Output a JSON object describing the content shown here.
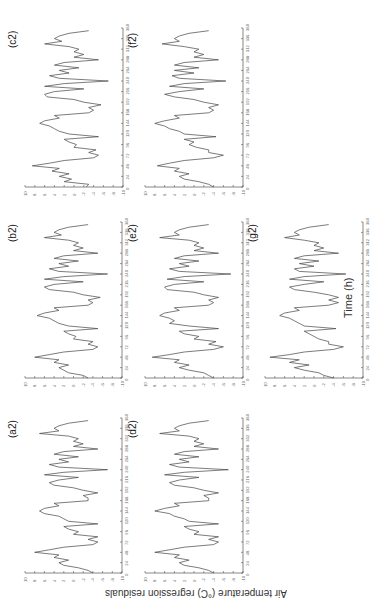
{
  "figure": {
    "xlabel": "Time (h)",
    "ylabel": "Air temperature (°C) regression residuals",
    "orientation": "rotated 90° counter-clockwise"
  },
  "chart_data": [
    {
      "type": "line",
      "title": "(c2)",
      "xlabel": "Time (h)",
      "ylabel": "Air temperature (°C) regression residuals",
      "xlim": [
        0,
        360
      ],
      "ylim": [
        -10,
        10
      ],
      "x_ticks": [
        0,
        24,
        48,
        72,
        96,
        120,
        144,
        168,
        192,
        216,
        240,
        264,
        288,
        312,
        336,
        360
      ],
      "y_ticks": [
        10,
        8,
        6,
        4,
        2,
        0,
        -2,
        -4,
        -6,
        -8,
        -10
      ],
      "x": [
        0,
        6,
        12,
        18,
        24,
        30,
        36,
        42,
        48,
        54,
        60,
        66,
        72,
        78,
        84,
        90,
        96,
        102,
        108,
        114,
        120,
        126,
        132,
        138,
        144,
        150,
        156,
        162,
        168,
        174,
        180,
        186,
        192,
        198,
        204,
        210,
        216,
        222,
        228,
        234,
        240,
        246,
        252,
        258,
        264,
        270,
        276,
        282,
        288,
        294,
        300,
        306,
        312,
        318,
        324,
        330,
        336,
        342,
        348,
        354
      ],
      "values": [
        -2.5,
        -3,
        2,
        0.5,
        3,
        1,
        4.5,
        3,
        8.5,
        5,
        2,
        -4,
        -5,
        -3,
        -4.5,
        0,
        -0.5,
        1,
        2,
        -5,
        1,
        3,
        4,
        5,
        7,
        6,
        3,
        4,
        -3,
        -4,
        -3,
        -5.5,
        -2,
        0,
        5.5,
        6,
        4,
        -2,
        6,
        2,
        -7,
        3,
        5,
        1,
        3,
        -1,
        4,
        2,
        -5,
        0,
        -2,
        0,
        -1,
        1,
        6,
        2.5,
        4,
        3,
        1,
        -3
      ]
    },
    {
      "type": "line",
      "title": "(f2)",
      "xlabel": "Time (h)",
      "ylabel": "Air temperature (°C) regression residuals",
      "xlim": [
        0,
        360
      ],
      "ylim": [
        -10,
        10
      ],
      "x_ticks": [
        0,
        24,
        48,
        72,
        96,
        120,
        144,
        168,
        192,
        216,
        240,
        264,
        288,
        312,
        336,
        360
      ],
      "y_ticks": [
        10,
        8,
        6,
        4,
        2,
        0,
        -2,
        -4,
        -6,
        -8,
        -10
      ],
      "x": [
        0,
        6,
        12,
        18,
        24,
        30,
        36,
        42,
        48,
        54,
        60,
        66,
        72,
        78,
        84,
        90,
        96,
        102,
        108,
        114,
        120,
        126,
        132,
        138,
        144,
        150,
        156,
        162,
        168,
        174,
        180,
        186,
        192,
        198,
        204,
        210,
        216,
        222,
        228,
        234,
        240,
        246,
        252,
        258,
        264,
        270,
        276,
        282,
        288,
        294,
        300,
        306,
        312,
        318,
        324,
        330,
        336,
        342,
        348,
        354
      ],
      "values": [
        -4,
        -3,
        -1,
        2,
        3,
        1,
        4,
        3,
        7.5,
        5,
        2,
        -4,
        -6,
        -3,
        -3,
        -0.5,
        1,
        0,
        2,
        -4.5,
        2,
        3,
        5,
        6,
        8,
        6,
        3,
        4,
        -3,
        -4,
        -3,
        -5,
        -2,
        0,
        4,
        6,
        3,
        -2,
        5,
        2,
        -6.5,
        3,
        4.5,
        0,
        4,
        -1,
        4,
        2,
        -5,
        0,
        -2,
        0,
        -1,
        2,
        6.5,
        3,
        4,
        3,
        1,
        -3
      ]
    },
    {
      "type": "line",
      "title": "(b2)",
      "xlabel": "Time (h)",
      "ylabel": "Air temperature (°C) regression residuals",
      "xlim": [
        0,
        360
      ],
      "ylim": [
        -10,
        10
      ],
      "x_ticks": [
        0,
        24,
        48,
        72,
        96,
        120,
        144,
        168,
        192,
        216,
        240,
        264,
        288,
        312,
        336,
        360
      ],
      "y_ticks": [
        10,
        8,
        6,
        4,
        2,
        0,
        -2,
        -4,
        -6,
        -8,
        -10
      ],
      "x": [
        0,
        6,
        12,
        18,
        24,
        30,
        36,
        42,
        48,
        54,
        60,
        66,
        72,
        78,
        84,
        90,
        96,
        102,
        108,
        114,
        120,
        126,
        132,
        138,
        144,
        150,
        156,
        162,
        168,
        174,
        180,
        186,
        192,
        198,
        204,
        210,
        216,
        222,
        228,
        234,
        240,
        246,
        252,
        258,
        264,
        270,
        276,
        282,
        288,
        294,
        300,
        306,
        312,
        318,
        324,
        330,
        336,
        342,
        348,
        354
      ],
      "values": [
        -3,
        -2,
        1,
        2,
        3,
        1,
        4,
        3,
        8,
        5,
        2,
        -4,
        -5,
        -3,
        -4,
        0,
        -0.5,
        1,
        2,
        -5,
        1,
        3,
        4,
        5,
        7.5,
        6,
        3,
        4,
        -3,
        -4,
        -3,
        -5.5,
        -2,
        0,
        5,
        6,
        4,
        -2,
        6,
        2,
        -7,
        3,
        5,
        1,
        3,
        -1,
        4,
        2,
        -5,
        0,
        -2,
        0,
        -1,
        1,
        6,
        2.5,
        4,
        3,
        1,
        -3
      ]
    },
    {
      "type": "line",
      "title": "(e2)",
      "xlabel": "Time (h)",
      "ylabel": "Air temperature (°C) regression residuals",
      "xlim": [
        0,
        360
      ],
      "ylim": [
        -10,
        10
      ],
      "x_ticks": [
        0,
        24,
        48,
        72,
        96,
        120,
        144,
        168,
        192,
        216,
        240,
        264,
        288,
        312,
        336,
        360
      ],
      "y_ticks": [
        10,
        8,
        6,
        4,
        2,
        0,
        -2,
        -4,
        -6,
        -8,
        -10
      ],
      "x": [
        0,
        6,
        12,
        18,
        24,
        30,
        36,
        42,
        48,
        54,
        60,
        66,
        72,
        78,
        84,
        90,
        96,
        102,
        108,
        114,
        120,
        126,
        132,
        138,
        144,
        150,
        156,
        162,
        168,
        174,
        180,
        186,
        192,
        198,
        204,
        210,
        216,
        222,
        228,
        234,
        240,
        246,
        252,
        258,
        264,
        270,
        276,
        282,
        288,
        294,
        300,
        306,
        312,
        318,
        324,
        330,
        336,
        342,
        348,
        354
      ],
      "values": [
        -4,
        -3,
        -2,
        1,
        3,
        1,
        4,
        3,
        8.5,
        5,
        2,
        -4,
        -6,
        -3,
        -4.5,
        0,
        -1,
        2,
        3,
        -5,
        1,
        5,
        4,
        5,
        7,
        6,
        3,
        4,
        -3,
        -4,
        -3,
        -5,
        -2,
        0,
        5.5,
        6,
        4,
        -2,
        5.5,
        2,
        -7.5,
        3,
        5,
        1,
        3,
        -1,
        4,
        2,
        -5,
        0,
        -2,
        0,
        -1,
        1,
        7,
        3,
        4,
        3,
        1,
        -3
      ]
    },
    {
      "type": "line",
      "title": "(g2)",
      "xlabel": "Time (h)",
      "ylabel": "Air temperature (°C) regression residuals",
      "xlim": [
        0,
        360
      ],
      "ylim": [
        -10,
        10
      ],
      "x_ticks": [
        0,
        24,
        48,
        72,
        96,
        120,
        144,
        168,
        192,
        216,
        240,
        264,
        288,
        312,
        336,
        360
      ],
      "y_ticks": [
        10,
        8,
        6,
        4,
        2,
        0,
        -2,
        -4,
        -6,
        -8,
        -10
      ],
      "x": [
        0,
        6,
        12,
        18,
        24,
        30,
        36,
        42,
        48,
        54,
        60,
        66,
        72,
        78,
        84,
        90,
        96,
        102,
        108,
        114,
        120,
        126,
        132,
        138,
        144,
        150,
        156,
        162,
        168,
        174,
        180,
        186,
        192,
        198,
        204,
        210,
        216,
        222,
        228,
        234,
        240,
        246,
        252,
        258,
        264,
        270,
        276,
        282,
        288,
        294,
        300,
        306,
        312,
        318,
        324,
        330,
        336,
        342,
        348,
        354
      ],
      "values": [
        -4,
        -2,
        -1,
        2,
        4,
        1,
        5,
        3,
        9,
        5,
        2,
        -4,
        -6,
        -3,
        -3,
        -1,
        0,
        1,
        2,
        -4.5,
        2,
        3,
        4,
        5,
        7,
        6,
        3,
        4,
        -3,
        -5,
        -3,
        -5,
        -3,
        0,
        4,
        5,
        2,
        -2,
        5,
        2,
        -6.5,
        3,
        4,
        0,
        3,
        -1,
        4,
        2,
        -5,
        0,
        -2,
        0,
        -1,
        2,
        6,
        3,
        4,
        3,
        1,
        -3
      ]
    },
    {
      "type": "line",
      "title": "(a2)",
      "xlabel": "Time (h)",
      "ylabel": "Air temperature (°C) regression residuals",
      "xlim": [
        0,
        360
      ],
      "ylim": [
        -10,
        10
      ],
      "x_ticks": [
        0,
        24,
        48,
        72,
        96,
        120,
        144,
        168,
        192,
        216,
        240,
        264,
        288,
        312,
        336,
        360
      ],
      "y_ticks": [
        10,
        8,
        6,
        4,
        2,
        0,
        -2,
        -4,
        -6,
        -8,
        -10
      ],
      "x": [
        0,
        6,
        12,
        18,
        24,
        30,
        36,
        42,
        48,
        54,
        60,
        66,
        72,
        78,
        84,
        90,
        96,
        102,
        108,
        114,
        120,
        126,
        132,
        138,
        144,
        150,
        156,
        162,
        168,
        174,
        180,
        186,
        192,
        198,
        204,
        210,
        216,
        222,
        228,
        234,
        240,
        246,
        252,
        258,
        264,
        270,
        276,
        282,
        288,
        294,
        300,
        306,
        312,
        318,
        324,
        330,
        336,
        342,
        348,
        354
      ],
      "values": [
        -4,
        -3,
        -1,
        2,
        3,
        1,
        4,
        3,
        8,
        5,
        2,
        -4,
        -5,
        -3,
        -5,
        0,
        -1,
        1,
        2,
        -5,
        1,
        2,
        3,
        6,
        7,
        6,
        3,
        4,
        -3,
        -3,
        -2,
        -5,
        -2,
        0,
        4,
        5,
        3,
        -1,
        6,
        2,
        -7,
        3,
        5,
        1,
        3,
        -1,
        4,
        2,
        -5,
        0,
        -2,
        0,
        -1,
        1,
        7,
        3,
        4,
        3,
        1,
        -3
      ]
    },
    {
      "type": "line",
      "title": "(d2)",
      "xlabel": "Time (h)",
      "ylabel": "Air temperature (°C) regression residuals",
      "xlim": [
        0,
        360
      ],
      "ylim": [
        -10,
        10
      ],
      "x_ticks": [
        0,
        24,
        48,
        72,
        96,
        120,
        144,
        168,
        192,
        216,
        240,
        264,
        288,
        312,
        336,
        360
      ],
      "y_ticks": [
        10,
        8,
        6,
        4,
        2,
        0,
        -2,
        -4,
        -6,
        -8,
        -10
      ],
      "x": [
        0,
        6,
        12,
        18,
        24,
        30,
        36,
        42,
        48,
        54,
        60,
        66,
        72,
        78,
        84,
        90,
        96,
        102,
        108,
        114,
        120,
        126,
        132,
        138,
        144,
        150,
        156,
        162,
        168,
        174,
        180,
        186,
        192,
        198,
        204,
        210,
        216,
        222,
        228,
        234,
        240,
        246,
        252,
        258,
        264,
        270,
        276,
        282,
        288,
        294,
        300,
        306,
        312,
        318,
        324,
        330,
        336,
        342,
        348,
        354
      ],
      "values": [
        -4,
        -3,
        -1,
        2,
        3,
        1,
        4,
        3,
        8,
        5,
        2,
        -4,
        -5,
        -3,
        -5,
        0,
        -1,
        1,
        2,
        -5,
        1,
        2,
        4,
        5,
        8,
        6,
        3,
        4,
        -3,
        -3,
        -2,
        -5,
        -2,
        0,
        4,
        5,
        3,
        -1,
        6,
        2,
        -7,
        3,
        5,
        1,
        3,
        -1,
        4,
        2,
        -5,
        0,
        -2,
        0,
        -1,
        1,
        7,
        3,
        4,
        3,
        1,
        -3
      ]
    }
  ],
  "layout": [
    {
      "title": "(c2)",
      "left": 25,
      "top": 28,
      "width": 98,
      "height": 159
    },
    {
      "title": "(f2)",
      "left": 145,
      "top": 28,
      "width": 98,
      "height": 159
    },
    {
      "title": "(b2)",
      "left": 25,
      "top": 222,
      "width": 97,
      "height": 156
    },
    {
      "title": "(e2)",
      "left": 145,
      "top": 222,
      "width": 98,
      "height": 156
    },
    {
      "title": "(g2)",
      "left": 265,
      "top": 222,
      "width": 98,
      "height": 156
    },
    {
      "title": "(a2)",
      "left": 25,
      "top": 418,
      "width": 97,
      "height": 155
    },
    {
      "title": "(d2)",
      "left": 145,
      "top": 418,
      "width": 98,
      "height": 155
    }
  ]
}
